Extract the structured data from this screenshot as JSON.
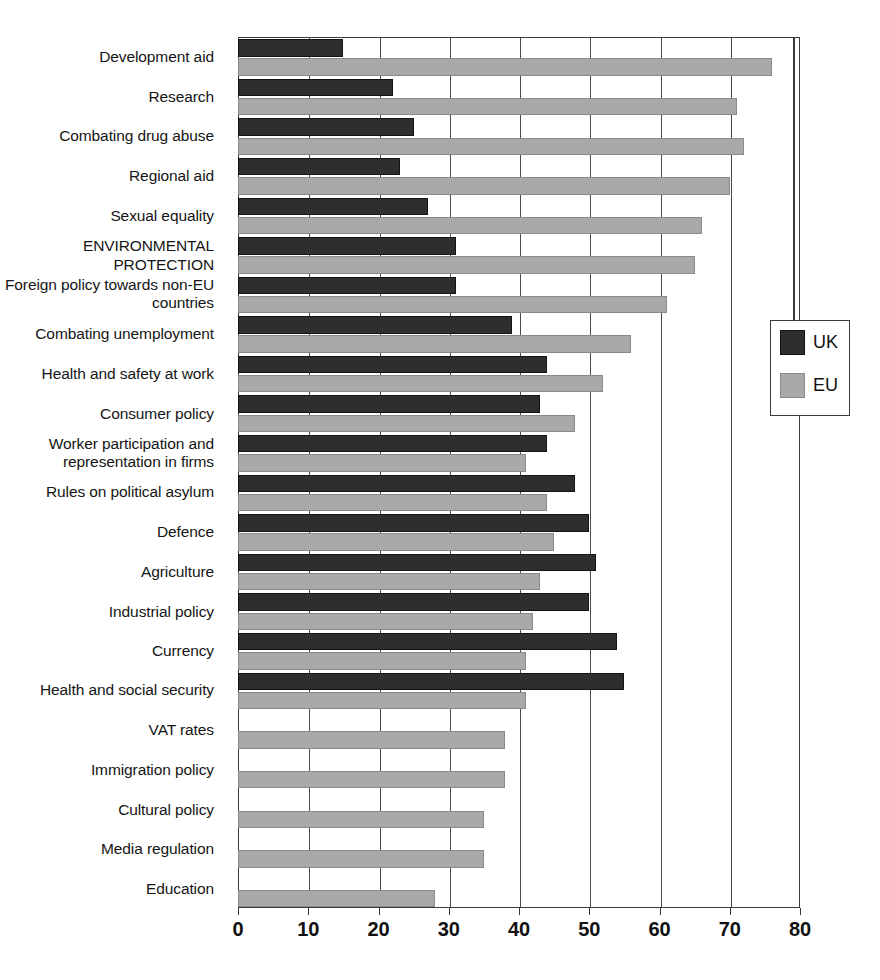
{
  "legend": {
    "title": "",
    "items": [
      {
        "label": "UK",
        "color": "#2e2e2e",
        "key": "uk"
      },
      {
        "label": "EU",
        "color": "#a9a9a9",
        "key": "eu"
      }
    ]
  },
  "axis": {
    "x_ticks": [
      "0",
      "10",
      "20",
      "30",
      "40",
      "50",
      "60",
      "70",
      "80"
    ]
  },
  "chart_data": {
    "type": "bar",
    "orientation": "horizontal",
    "title": "",
    "subtitle": "",
    "xlabel": "",
    "ylabel": "",
    "xlim": [
      0,
      80
    ],
    "xticks": [
      0,
      10,
      20,
      30,
      40,
      50,
      60,
      70,
      80
    ],
    "grid": true,
    "legend_position": "right",
    "categories": [
      "Development aid",
      "Research",
      "Combating drug abuse",
      "Regional aid",
      "Sexual equality",
      "ENVIRONMENTAL PROTECTION",
      "Foreign policy towards non-EU countries",
      "Combating unemployment",
      "Health and safety at work",
      "Consumer policy",
      "Worker participation and representation in firms",
      "Rules on political asylum",
      "Defence",
      "Agriculture",
      "Industrial policy",
      "Currency",
      "Health and social security",
      "VAT rates",
      "Immigration policy",
      "Cultural policy",
      "Media regulation",
      "Education"
    ],
    "series": [
      {
        "name": "UK",
        "color": "#2e2e2e",
        "values": [
          15,
          22,
          25,
          23,
          27,
          31,
          31,
          39,
          44,
          43,
          44,
          48,
          50,
          51,
          50,
          54,
          55,
          null,
          null,
          null,
          null,
          null
        ]
      },
      {
        "name": "EU",
        "color": "#a9a9a9",
        "values": [
          76,
          71,
          72,
          70,
          66,
          65,
          61,
          56,
          52,
          48,
          41,
          44,
          45,
          43,
          42,
          41,
          41,
          38,
          38,
          35,
          35,
          28
        ]
      }
    ]
  }
}
